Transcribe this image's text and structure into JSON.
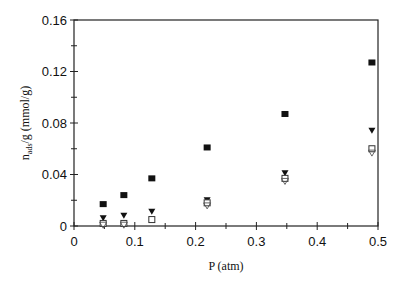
{
  "chart_data": {
    "type": "scatter",
    "title": "",
    "xlabel": "P (atm)",
    "ylabel": "n_ads/g (mmol/g)",
    "ylabel_main": "n",
    "ylabel_sub": "ads",
    "ylabel_rest": "/g (mmol/g)",
    "xlim": [
      0,
      0.5
    ],
    "ylim": [
      0,
      0.16
    ],
    "x_ticks": [
      "0",
      "0.1",
      "0.2",
      "0.3",
      "0.4",
      "0.5"
    ],
    "y_ticks": [
      "0",
      "0.04",
      "0.08",
      "0.12",
      "0.16"
    ],
    "grid": false,
    "legend": "none",
    "series": [
      {
        "name": "filled-square",
        "marker": "square-filled",
        "x": [
          0.048,
          0.082,
          0.128,
          0.219,
          0.347,
          0.49
        ],
        "y": [
          0.017,
          0.024,
          0.037,
          0.061,
          0.087,
          0.127
        ]
      },
      {
        "name": "filled-triangle",
        "marker": "triangle-down-filled",
        "x": [
          0.048,
          0.082,
          0.128,
          0.219,
          0.347,
          0.49
        ],
        "y": [
          0.006,
          0.008,
          0.011,
          0.02,
          0.041,
          0.074
        ]
      },
      {
        "name": "open-square",
        "marker": "square-open",
        "x": [
          0.048,
          0.082,
          0.128,
          0.219,
          0.347,
          0.49
        ],
        "y": [
          0.002,
          0.002,
          0.005,
          0.018,
          0.037,
          0.06
        ]
      },
      {
        "name": "open-triangle",
        "marker": "triangle-down-open",
        "x": [
          0.048,
          0.082,
          0.219,
          0.347,
          0.49
        ],
        "y": [
          0.001,
          0.001,
          0.016,
          0.035,
          0.057
        ]
      }
    ]
  }
}
